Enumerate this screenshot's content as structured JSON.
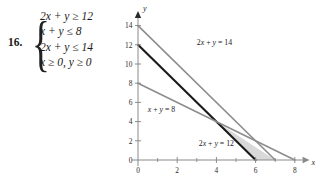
{
  "problem": {
    "number": "16.",
    "inequalities": [
      "2x + y ≥ 12",
      "x + y ≤ 8",
      "2x + y ≤ 14",
      "x ≥ 0, y ≥ 0"
    ]
  },
  "chart_data": {
    "type": "line",
    "title": "",
    "xlabel": "x",
    "ylabel": "y",
    "xlim": [
      0,
      8.6
    ],
    "ylim": [
      0,
      15.2
    ],
    "grid": false,
    "legend": "inline-annotations",
    "x_ticks": [
      0,
      2,
      4,
      6,
      8
    ],
    "x_minor_ticks": [
      1,
      3,
      5,
      7
    ],
    "y_ticks": [
      0,
      2,
      4,
      6,
      8,
      10,
      12,
      14
    ],
    "x_tick_labels": [
      "0",
      "2",
      "4",
      "6",
      "8"
    ],
    "y_tick_labels": [
      "0",
      "2",
      "4",
      "6",
      "8",
      "10",
      "12",
      "14"
    ],
    "series": [
      {
        "name": "2x + y = 14",
        "label": "2x + y = 14",
        "color": "#8d8d8d",
        "width": 1.6,
        "x": [
          0,
          7
        ],
        "y": [
          14,
          0
        ],
        "label_x": 3.0,
        "label_y": 12.0
      },
      {
        "name": "2x + y = 12",
        "label": "2x + y = 12",
        "color": "#1a1a1a",
        "width": 2.1,
        "x": [
          0,
          6
        ],
        "y": [
          12,
          0
        ],
        "label_x": 3.1,
        "label_y": 1.45
      },
      {
        "name": "x + y = 8",
        "label": "x + y = 8",
        "color": "#8d8d8d",
        "width": 1.6,
        "x": [
          0,
          8
        ],
        "y": [
          8,
          0
        ],
        "label_x": 0.5,
        "label_y": 5.0
      }
    ],
    "feasible_region": {
      "name": "solution-region",
      "fill": "#d9d9d9",
      "vertices": [
        [
          4,
          4
        ],
        [
          6,
          0
        ],
        [
          7,
          0
        ]
      ]
    },
    "axis_color": "#8a8a8a"
  }
}
